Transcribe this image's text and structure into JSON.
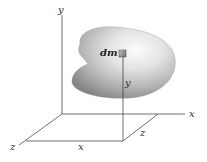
{
  "figure": {
    "axes": {
      "y_label": "y",
      "x_label": "x",
      "z_label": "z"
    },
    "element": {
      "label": "dm"
    },
    "dimension_labels": {
      "vertical_y": "y",
      "bottom_x": "x",
      "side_z": "z"
    },
    "colors": {
      "line": "#333333",
      "body_light": "#f2f2f2",
      "body_dark": "#8a8a8a",
      "background": "#ffffff"
    }
  }
}
